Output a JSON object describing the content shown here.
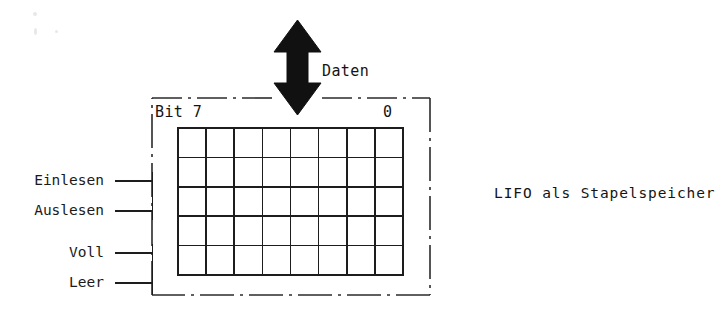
{
  "diagram": {
    "caption": "LIFO als Stapelspeicher",
    "data_arrow_label": "Daten",
    "bit_msb_label": "Bit 7",
    "bit_lsb_label": "0",
    "signals": [
      {
        "label": "Einlesen"
      },
      {
        "label": "Auslesen"
      },
      {
        "label": "Voll"
      },
      {
        "label": "Leer"
      }
    ],
    "memory_grid": {
      "columns": 8,
      "rows": 5
    },
    "colors": {
      "ink": "#141414",
      "background": "#ffffff",
      "frame": "#2b2b2b"
    }
  }
}
